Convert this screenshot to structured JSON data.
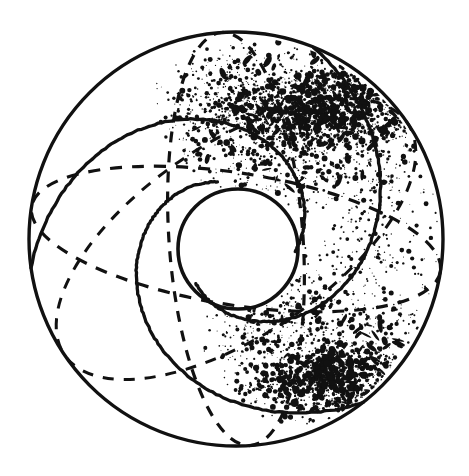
{
  "figure": {
    "kind": "technical-line-drawing",
    "width": 469,
    "height": 476,
    "background_color": "#ffffff",
    "ink_color": "#111111"
  },
  "geometry": {
    "outer_sphere": {
      "name": "outer sphere outline",
      "cx": 236,
      "cy": 239,
      "r": 207,
      "stroke_width": 3.4,
      "style": "solid"
    },
    "inner_circle": {
      "name": "inner core circle",
      "cx": 238,
      "cy": 249,
      "r": 60,
      "stroke_width": 3.6,
      "style": "solid"
    },
    "spiral_arms": {
      "count": 3,
      "rotation_offsets_deg": [
        0,
        120,
        240
      ],
      "base_rotation_deg": -8,
      "stroke_width": 3.3,
      "style": "solid",
      "description": "three logarithmic spiral arcs running from tangency on the outer sphere inward to wrap the inner core circle"
    },
    "spiral_sweep": {
      "start_radius": 207,
      "end_radius": 60,
      "sweep_deg": 200,
      "start_angle_deg": 180
    },
    "dashed_great_circles": [
      {
        "name": "meridian-vertical",
        "cx": 236,
        "cy": 239,
        "rx": 67,
        "ry": 207,
        "rotation_deg": -4,
        "dash_pattern": "11 9",
        "stroke_width": 3.2
      },
      {
        "name": "equator-horizontal",
        "cx": 236,
        "cy": 239,
        "rx": 207,
        "ry": 66,
        "rotation_deg": 9,
        "dash_pattern": "12 10",
        "stroke_width": 3.2
      },
      {
        "name": "meridian-oblique-right",
        "cx": 236,
        "cy": 239,
        "rx": 96,
        "ry": 207,
        "rotation_deg": 56,
        "dash_pattern": "11 10",
        "stroke_width": 3.0
      }
    ]
  },
  "stipple": {
    "name": "stippled shading texture",
    "description": "dense speckle shading concentrated in the upper-right band and the lower-right band of the sphere, fading toward the centre and absent on the left",
    "dot_color": "#111111",
    "seed": 20240917,
    "regions": [
      {
        "label": "upper-right dense band",
        "cx": 300,
        "cy": 120,
        "rx": 140,
        "ry": 85,
        "density": 1900,
        "max_dot": 3.4,
        "intensity": 1.0
      },
      {
        "label": "upper-right heavy core",
        "cx": 320,
        "cy": 110,
        "rx": 105,
        "ry": 42,
        "density": 1500,
        "max_dot": 4.0,
        "intensity": 1.0
      },
      {
        "label": "upper-centre sparse haze",
        "cx": 225,
        "cy": 105,
        "rx": 75,
        "ry": 60,
        "density": 520,
        "max_dot": 2.6,
        "intensity": 0.55
      },
      {
        "label": "right-middle fade",
        "cx": 370,
        "cy": 235,
        "rx": 72,
        "ry": 105,
        "density": 780,
        "max_dot": 2.8,
        "intensity": 0.55
      },
      {
        "label": "lower-right dense band",
        "cx": 330,
        "cy": 360,
        "rx": 110,
        "ry": 72,
        "density": 1450,
        "max_dot": 3.6,
        "intensity": 0.95
      },
      {
        "label": "lower-right heavy core",
        "cx": 330,
        "cy": 382,
        "rx": 72,
        "ry": 30,
        "density": 900,
        "max_dot": 4.2,
        "intensity": 1.0
      },
      {
        "label": "lower-centre sparse haze",
        "cx": 250,
        "cy": 330,
        "rx": 70,
        "ry": 45,
        "density": 330,
        "max_dot": 2.2,
        "intensity": 0.4
      },
      {
        "label": "centre-right faint speckle",
        "cx": 300,
        "cy": 280,
        "rx": 60,
        "ry": 50,
        "density": 260,
        "max_dot": 2.0,
        "intensity": 0.35
      }
    ],
    "clip": {
      "cx": 236,
      "cy": 239,
      "r": 203
    },
    "exclude": {
      "cx": 238,
      "cy": 249,
      "r": 62
    }
  }
}
